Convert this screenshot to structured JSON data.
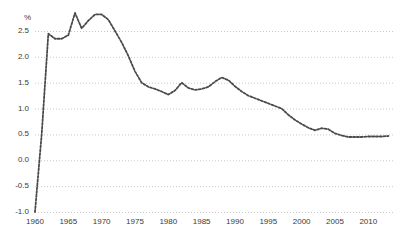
{
  "chart_data": {
    "type": "line",
    "title": "",
    "subtitle": "",
    "xlabel": "",
    "ylabel": "%",
    "ylim": [
      -1.0,
      3.0
    ],
    "xlim": [
      1960,
      2014
    ],
    "grid": true,
    "legend": null,
    "line_style": "dotted",
    "line_color": "#4a4a4a",
    "grid_color": "#c8c8c8",
    "y_ticks": [
      "2.5",
      "2.0",
      "1.5",
      "1.0",
      "0.5",
      "0.0",
      "-0.5",
      "-1.0"
    ],
    "y_tick_values": [
      2.5,
      2.0,
      1.5,
      1.0,
      0.5,
      0.0,
      -0.5,
      -1.0
    ],
    "x_ticks": [
      "1960",
      "1965",
      "1970",
      "1975",
      "1980",
      "1985",
      "1990",
      "1995",
      "2000",
      "2005",
      "2010"
    ],
    "x_tick_values": [
      1960,
      1965,
      1970,
      1975,
      1980,
      1985,
      1990,
      1995,
      2000,
      2005,
      2010
    ],
    "x": [
      1960,
      1961,
      1962,
      1963,
      1964,
      1965,
      1966,
      1967,
      1968,
      1969,
      1970,
      1971,
      1972,
      1973,
      1974,
      1975,
      1976,
      1977,
      1978,
      1979,
      1980,
      1981,
      1982,
      1983,
      1984,
      1985,
      1986,
      1987,
      1988,
      1989,
      1990,
      1991,
      1992,
      1993,
      1994,
      1995,
      1996,
      1997,
      1998,
      1999,
      2000,
      2001,
      2002,
      2003,
      2004,
      2005,
      2006,
      2007,
      2008,
      2009,
      2010,
      2011,
      2012,
      2013
    ],
    "values": [
      -1.0,
      0.5,
      2.45,
      2.35,
      2.35,
      2.42,
      2.85,
      2.55,
      2.7,
      2.82,
      2.82,
      2.72,
      2.5,
      2.28,
      2.02,
      1.72,
      1.5,
      1.42,
      1.38,
      1.33,
      1.27,
      1.35,
      1.5,
      1.4,
      1.36,
      1.38,
      1.42,
      1.52,
      1.6,
      1.55,
      1.43,
      1.33,
      1.25,
      1.2,
      1.15,
      1.1,
      1.05,
      1.0,
      0.88,
      0.78,
      0.7,
      0.63,
      0.58,
      0.62,
      0.6,
      0.52,
      0.48,
      0.45,
      0.45,
      0.45,
      0.46,
      0.46,
      0.46,
      0.47
    ],
    "values_label": "Annual rate (%)"
  }
}
